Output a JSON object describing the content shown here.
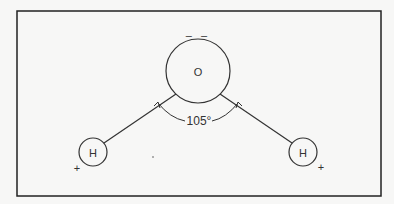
{
  "diagram": {
    "atoms": {
      "oxygen": {
        "label": "O",
        "charge": "– –"
      },
      "hydrogen_left": {
        "label": "H",
        "charge": "+"
      },
      "hydrogen_right": {
        "label": "H",
        "charge": "+"
      }
    },
    "bond_angle": "105°"
  }
}
